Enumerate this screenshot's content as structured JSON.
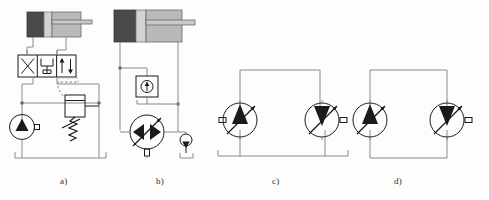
{
  "figure": {
    "panels": [
      {
        "id": "a",
        "label": "a)",
        "caption": "Fixed displacement pump with 4/3 directional valve and pressure relief valve",
        "components": [
          {
            "name": "double-acting-cylinder",
            "type": "cylinder",
            "fill_cap": "#4a4a4a",
            "fill_body": "#b9b9b9"
          },
          {
            "name": "directional-control-valve-4-3",
            "type": "valve",
            "positions": 3,
            "ports": 4
          },
          {
            "name": "fixed-displacement-pump",
            "type": "pump",
            "displacement": "fixed",
            "triangle": "up",
            "circle_fill": "#ffffff"
          },
          {
            "name": "pressure-relief-valve",
            "type": "relief-valve",
            "spring": true,
            "pilot_line": "dashed"
          },
          {
            "name": "reservoir-tank",
            "type": "tank"
          }
        ]
      },
      {
        "id": "b",
        "label": "b)",
        "caption": "Variable displacement reversible pump with check valve and tank",
        "components": [
          {
            "name": "double-acting-cylinder",
            "type": "cylinder",
            "fill_cap": "#4a4a4a",
            "fill_body": "#b9b9b9"
          },
          {
            "name": "check-valve-boxed",
            "type": "check-valve",
            "boxed": true
          },
          {
            "name": "variable-displacement-pump-bidirectional",
            "type": "pump",
            "displacement": "variable",
            "triangle": "both",
            "circle_fill": "#ffffff"
          },
          {
            "name": "reservoir-tank-small",
            "type": "tank"
          },
          {
            "name": "reservoir-tank",
            "type": "tank"
          }
        ]
      },
      {
        "id": "c",
        "label": "c)",
        "caption": "Open circuit: variable pump driving variable motor",
        "components": [
          {
            "name": "variable-displacement-pump",
            "type": "pump",
            "displacement": "variable",
            "triangle": "up",
            "circle_fill": "#ffffff"
          },
          {
            "name": "variable-displacement-motor",
            "type": "motor",
            "displacement": "variable",
            "triangle": "down",
            "circle_fill": "#bcbcbc"
          },
          {
            "name": "reservoir-tank",
            "type": "tank"
          }
        ]
      },
      {
        "id": "d",
        "label": "d)",
        "caption": "Closed circuit: variable pump and variable motor loop",
        "components": [
          {
            "name": "variable-displacement-pump",
            "type": "pump",
            "displacement": "variable",
            "triangle": "up",
            "circle_fill": "#ffffff"
          },
          {
            "name": "variable-displacement-motor",
            "type": "motor",
            "displacement": "variable",
            "triangle": "down",
            "circle_fill": "#bcbcbc"
          }
        ]
      }
    ]
  },
  "colors": {
    "line": "#8a8a8a",
    "line_dark": "#555555",
    "stroke_black": "#1a1a1a",
    "cylinder_cap": "#4a4a4a",
    "cylinder_body": "#b9b9b9",
    "cylinder_rod": "#c9c9c9",
    "motor_fill": "#bcbcbc",
    "pump_fill": "#ffffff",
    "background": "#fdfdfd",
    "label_text": "#2b2b2b"
  }
}
